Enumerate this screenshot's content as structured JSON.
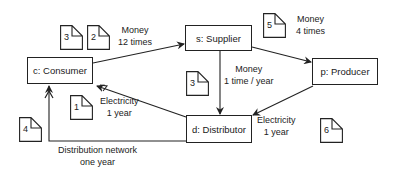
{
  "diagram": {
    "nodes": [
      {
        "id": "c",
        "label": "c: Consumer"
      },
      {
        "id": "s",
        "label": "s: Supplier"
      },
      {
        "id": "p",
        "label": "p: Producer"
      },
      {
        "id": "d",
        "label": "d: Distributor"
      }
    ],
    "edges": [
      {
        "from": "c",
        "to": "s",
        "label_line1": "Money",
        "label_line2": "12 times"
      },
      {
        "from": "s",
        "to": "p",
        "label_line1": "Money",
        "label_line2": "4 times"
      },
      {
        "from": "s",
        "to": "d",
        "label_line1": "Money",
        "label_line2": "1 time / year"
      },
      {
        "from": "p",
        "to": "d",
        "label_line1": "Electricity",
        "label_line2": "1 year"
      },
      {
        "from": "d",
        "to": "c",
        "label_line1": "Electricity",
        "label_line2": "1 year"
      },
      {
        "from": "d",
        "to": "c",
        "label_line1": "Distribution network",
        "label_line2": "one year"
      }
    ],
    "documents": [
      {
        "number": "3",
        "near": "money-12-times"
      },
      {
        "number": "2",
        "near": "money-12-times"
      },
      {
        "number": "5",
        "near": "money-4-times"
      },
      {
        "number": "3",
        "near": "money-1-time-year"
      },
      {
        "number": "1",
        "near": "electricity-d-to-c"
      },
      {
        "number": "4",
        "near": "distribution-network"
      },
      {
        "number": "6",
        "near": "electricity-p-to-d"
      }
    ]
  }
}
